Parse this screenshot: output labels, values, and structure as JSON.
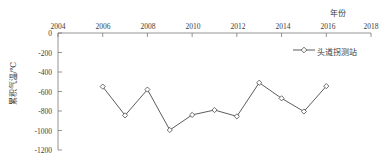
{
  "chart_data": {
    "type": "line",
    "title": "",
    "xlabel": "年份",
    "ylabel": "累积气温/℃",
    "xlim": [
      2004,
      2018
    ],
    "ylim": [
      -1200,
      0
    ],
    "x_ticks": [
      2004,
      2006,
      2008,
      2010,
      2012,
      2014,
      2016,
      2018
    ],
    "x_tick_labels": [
      "2004",
      "2006",
      "2008",
      "2010",
      "2012",
      "2014",
      "2016",
      "2018"
    ],
    "y_ticks": [
      0,
      -200,
      -400,
      -600,
      -800,
      -1000,
      -1200
    ],
    "y_tick_labels": [
      "0",
      "-200",
      "-400",
      "-600",
      "-800",
      "-1000",
      "-1200"
    ],
    "grid": false,
    "legend_position": "top-right",
    "series": [
      {
        "name": "头道拐测站",
        "marker": "diamond",
        "color": "#4a4a4a",
        "x": [
          2006,
          2007,
          2008,
          2009,
          2010,
          2011,
          2012,
          2013,
          2014,
          2015,
          2016
        ],
        "values": [
          -550,
          -845,
          -580,
          -995,
          -840,
          -790,
          -855,
          -510,
          -670,
          -805,
          -545
        ]
      }
    ]
  },
  "legend": {
    "entries": [
      {
        "label": "头道拐测站"
      }
    ]
  },
  "axes": {
    "x_title": "年份",
    "y_title": "累积气温/℃"
  }
}
